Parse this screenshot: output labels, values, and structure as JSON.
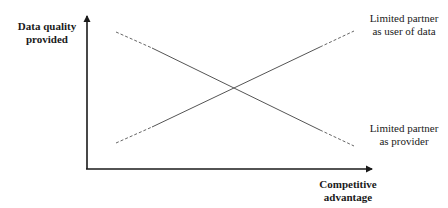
{
  "diagram": {
    "y_axis_label_line1": "Data quality",
    "y_axis_label_line2": "provided",
    "x_axis_label_line1": "Competitive",
    "x_axis_label_line2": "advantage",
    "line_user": {
      "label_line1": "Limited partner",
      "label_line2": "as user of data",
      "direction": "increasing"
    },
    "line_provider": {
      "label_line1": "Limited partner",
      "label_line2": "as provider",
      "direction": "decreasing"
    },
    "colors": {
      "axis": "#1a1a1a",
      "line": "#555555"
    }
  }
}
